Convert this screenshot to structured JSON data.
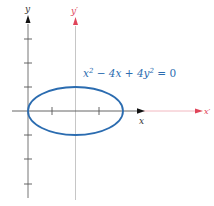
{
  "diagram": {
    "equation": "x² − 4x + 4y² = 0",
    "equation_parts": {
      "a": "x",
      "a_sup": "2",
      "b": " − 4x + 4y",
      "b_sup": "2",
      "c": " = 0"
    },
    "axes": {
      "original": {
        "x_label": "x",
        "y_label": "y",
        "color": "#222222"
      },
      "translated": {
        "x_label": "x′",
        "y_label": "y′",
        "color": "#e0455a"
      }
    },
    "curve": {
      "type": "ellipse",
      "center": [
        2,
        0
      ],
      "semi_major": 2,
      "semi_minor": 1,
      "color": "#2b6cb0"
    },
    "colors": {
      "equation_text": "#2b6cb0",
      "axis_gray": "#aaaaaa",
      "translated_axis_line": "#f2b8c0"
    }
  }
}
